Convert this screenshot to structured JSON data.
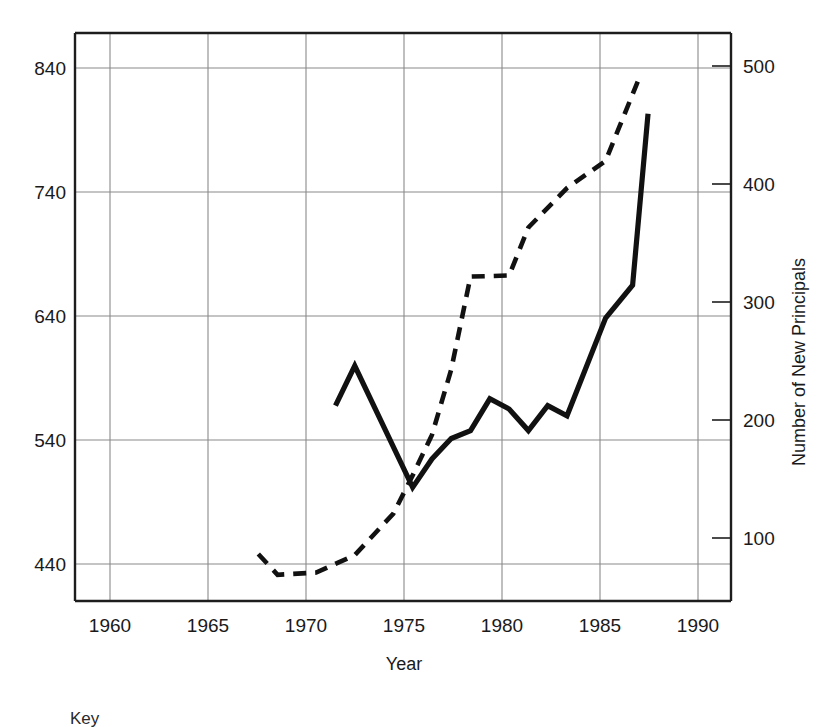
{
  "chart_data": {
    "type": "line",
    "title": "",
    "xlabel": "Year",
    "ylabel_left": "",
    "ylabel_right": "Number of New Principals",
    "xlim": [
      1957.5,
      1991.5
    ],
    "ylim_left": [
      390,
      890
    ],
    "ylim_right": [
      20,
      540
    ],
    "grid": true,
    "legend_position": "below-plot",
    "x_ticks": [
      "1960",
      "1965",
      "1970",
      "1975",
      "1980",
      "1985",
      "1990"
    ],
    "x_tick_values": [
      1960,
      1965,
      1970,
      1975,
      1980,
      1985,
      1990
    ],
    "y_ticks_left": [
      "440",
      "540",
      "640",
      "740",
      "840"
    ],
    "y_tick_values_left": [
      440,
      540,
      640,
      740,
      840
    ],
    "y_ticks_right": [
      "100",
      "200",
      "300",
      "400",
      "500"
    ],
    "y_tick_values_right": [
      100,
      200,
      300,
      400,
      500
    ],
    "series": [
      {
        "name": "solid-series",
        "style": "solid",
        "axis": "left",
        "x": [
          1971,
          1972,
          1975,
          1976,
          1977,
          1978,
          1979,
          1980,
          1981,
          1982,
          1983,
          1985,
          1986.4,
          1987.2
        ],
        "values": [
          562,
          597,
          490,
          515,
          533,
          540,
          568,
          559,
          540,
          562,
          553,
          639,
          668,
          819
        ]
      },
      {
        "name": "dashed-series",
        "style": "dashed",
        "axis": "right",
        "x": [
          1967,
          1968,
          1970,
          1972,
          1974,
          1975,
          1976,
          1977,
          1978,
          1980,
          1981,
          1983,
          1985,
          1986.7
        ],
        "values": [
          63,
          44,
          46,
          62,
          100,
          135,
          172,
          232,
          317,
          318,
          362,
          398,
          423,
          497
        ]
      }
    ],
    "annotations": []
  },
  "key": {
    "label": "Key"
  }
}
